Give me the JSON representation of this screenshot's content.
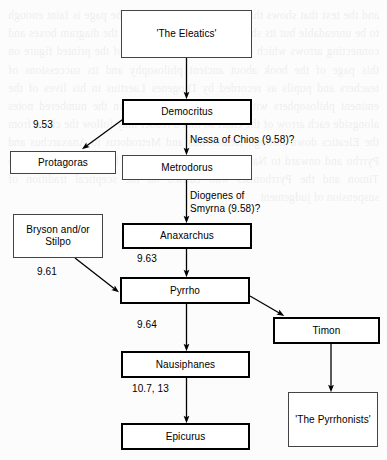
{
  "diagram": {
    "type": "flowchart",
    "title": "",
    "background_color": "#fcfcfc",
    "nodes": [
      {
        "id": "eleatics",
        "label": "'The Eleatics'",
        "style": "thin",
        "x": 121,
        "y": 10,
        "w": 131,
        "h": 48
      },
      {
        "id": "democritus",
        "label": "Democritus",
        "style": "bold",
        "x": 122,
        "y": 99,
        "w": 130,
        "h": 26
      },
      {
        "id": "protagoras",
        "label": "Protagoras",
        "style": "thin",
        "x": 10,
        "y": 151,
        "w": 106,
        "h": 23
      },
      {
        "id": "metrodorus",
        "label": "Metrodorus",
        "style": "thin",
        "x": 122,
        "y": 155,
        "w": 130,
        "h": 25
      },
      {
        "id": "bryson",
        "label": "Bryson and/or\nStilpo",
        "style": "thin",
        "x": 13,
        "y": 214,
        "w": 90,
        "h": 44
      },
      {
        "id": "anaxarchus",
        "label": "Anaxarchus",
        "style": "bold",
        "x": 122,
        "y": 223,
        "w": 130,
        "h": 26
      },
      {
        "id": "pyrrho",
        "label": "Pyrrho",
        "style": "bold",
        "x": 120,
        "y": 277,
        "w": 130,
        "h": 27
      },
      {
        "id": "timon",
        "label": "Timon",
        "style": "bold",
        "x": 273,
        "y": 317,
        "w": 107,
        "h": 27
      },
      {
        "id": "nausiphanes",
        "label": "Nausiphanes",
        "style": "bold",
        "x": 121,
        "y": 351,
        "w": 129,
        "h": 27
      },
      {
        "id": "pyrrhonists",
        "label": "'The Pyrrhonists'",
        "style": "thin",
        "x": 288,
        "y": 392,
        "w": 90,
        "h": 55
      },
      {
        "id": "epicurus",
        "label": "Epicurus",
        "style": "bold",
        "x": 121,
        "y": 423,
        "w": 129,
        "h": 27
      }
    ],
    "edges": [
      {
        "id": "eleatics-democritus",
        "from": "eleatics",
        "to": "democritus",
        "label": ""
      },
      {
        "id": "democritus-protagoras",
        "from": "democritus",
        "to": "protagoras",
        "label": "9.53"
      },
      {
        "id": "democritus-metrodorus",
        "from": "democritus",
        "to": "metrodorus",
        "label": "Nessa of Chios (9.58)?"
      },
      {
        "id": "metrodorus-anaxarchus",
        "from": "metrodorus",
        "to": "anaxarchus",
        "label": "Diogenes of\nSmyrna (9.58)?"
      },
      {
        "id": "anaxarchus-pyrrho",
        "from": "anaxarchus",
        "to": "pyrrho",
        "label": "9.63"
      },
      {
        "id": "bryson-pyrrho",
        "from": "bryson",
        "to": "pyrrho",
        "label": "9.61"
      },
      {
        "id": "pyrrho-timon",
        "from": "pyrrho",
        "to": "timon",
        "label": ""
      },
      {
        "id": "pyrrho-nausiphanes",
        "from": "pyrrho",
        "to": "nausiphanes",
        "label": "9.64"
      },
      {
        "id": "nausiphanes-epicurus",
        "from": "nausiphanes",
        "to": "epicurus",
        "label": "10.7, 13"
      },
      {
        "id": "timon-pyrrhonists",
        "from": "timon",
        "to": "pyrrhonists",
        "label": ""
      }
    ],
    "edge_labels": [
      {
        "id": "label-953",
        "text": "9.53",
        "x": 33,
        "y": 119
      },
      {
        "id": "label-nessa",
        "text": "Nessa of Chios (9.58)?",
        "x": 190,
        "y": 134
      },
      {
        "id": "label-diogenes",
        "text": "Diogenes of\nSmyrna (9.58)?",
        "x": 190,
        "y": 190
      },
      {
        "id": "label-963",
        "text": "9.63",
        "x": 137,
        "y": 253
      },
      {
        "id": "label-961",
        "text": "9.61",
        "x": 37,
        "y": 266
      },
      {
        "id": "label-964",
        "text": "9.64",
        "x": 137,
        "y": 319
      },
      {
        "id": "label-107-13",
        "text": "10.7, 13",
        "x": 132,
        "y": 383
      }
    ]
  },
  "bleed_text": "and the text that shows through from the reverse of the page is faint enough to be unreadable but its shapes remain visible behind the diagram boxes and connecting arrows which dominate the composition of the printed figure on this page of the book about ancient philosophy and its successions of teachers and pupils as recorded by Diogenes Laertius in his lives of the eminent philosophers with cross references given in the numbered notes alongside each arrow of the chart so that a reader may follow the chain from the Eleatics down through Democritus and Metrodorus to Anaxarchus and Pyrrho and onward to Nausiphanes and Epicurus or by the other branch to Timon and the Pyrrhonists who carried on the sceptical tradition of suspension of judgement"
}
